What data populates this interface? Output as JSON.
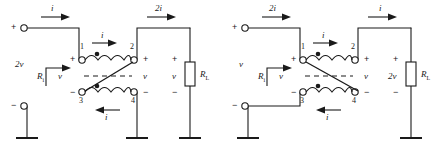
{
  "figure": {
    "stroke_color": "#1a1a1a",
    "background": "#ffffff"
  },
  "circuits": [
    {
      "id": "left",
      "name": "left-circuit",
      "input_current_label": "i",
      "output_current_label": "2i",
      "coil_top_current_label": "i",
      "coil_bottom_current_label": "i",
      "source_voltage_label": "2v",
      "input_resistance_label": "R",
      "input_resistance_sub": "i",
      "input_port_voltage_label": "v",
      "secondary_voltage_label": "v",
      "load_voltage_label": "v",
      "load_resistor_label": "R",
      "load_resistor_sub": "L",
      "terminals": [
        "1",
        "2",
        "3",
        "4"
      ],
      "plus": "+",
      "minus": "−",
      "crossover": "3-to-2"
    },
    {
      "id": "right",
      "name": "right-circuit",
      "input_current_label": "2i",
      "output_current_label": "i",
      "coil_top_current_label": "i",
      "coil_bottom_current_label": "i",
      "source_voltage_label": "v",
      "input_resistance_label": "R",
      "input_resistance_sub": "i",
      "input_port_voltage_label": "v",
      "secondary_voltage_label": "v",
      "load_voltage_label": "2v",
      "load_resistor_label": "R",
      "load_resistor_sub": "L",
      "terminals": [
        "1",
        "2",
        "3",
        "4"
      ],
      "plus": "+",
      "minus": "−",
      "crossover": "1-to-4"
    }
  ]
}
